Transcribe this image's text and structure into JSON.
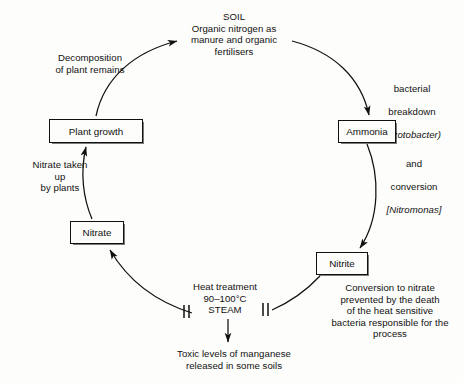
{
  "diagram": {
    "nodes": {
      "soil": "SOIL\nOrganic nitrogen as\nmanure and organic\nfertilisers",
      "plant_growth": "Plant growth",
      "nitrate": "Nitrate",
      "nitrite": "Nitrite",
      "ammonia": "Ammonia"
    },
    "annotations": {
      "decomposition": "Decomposition\nof plant remains",
      "bacterial_breakdown_line1": "bacterial",
      "bacterial_breakdown_line2": "breakdown",
      "bacterial_breakdown_organism": "(Azotobacter)",
      "conversion_line1": "and",
      "conversion_line2": "conversion",
      "conversion_organism": "[Nitromonas]",
      "nitrate_uptake": "Nitrate taken\nup\nby plants",
      "heat_treatment": "Heat treatment\n90–100°C\nSTEAM",
      "prevented": "Conversion to nitrate\nprevented by the death\nof the heat sensitive\nbacteria responsible for the\nprocess",
      "toxic": "Toxic levels of manganese\nreleased in some soils"
    },
    "colors": {
      "ink": "#111111",
      "background": "#fdfdfb"
    }
  }
}
